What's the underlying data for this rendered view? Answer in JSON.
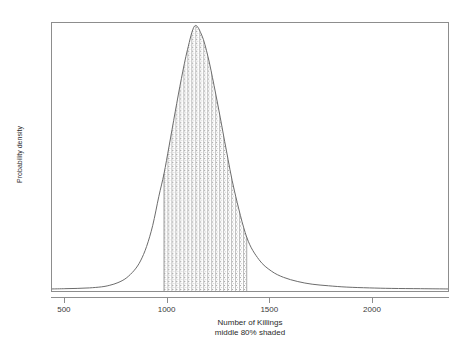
{
  "chart_data": {
    "type": "area",
    "title": "",
    "xlabel": "Number of Killings",
    "sublabel": "middle 80% shaded",
    "ylabel": "Probability density",
    "xlim": [
      437,
      2375
    ],
    "ylim": [
      0,
      1
    ],
    "grid": false,
    "legend": null,
    "xticks": [
      500,
      1000,
      1500,
      2000
    ],
    "xtick_labels": [
      "500",
      "1000",
      "1500",
      "2000"
    ],
    "yticks": [],
    "ytick_labels": [],
    "distribution": {
      "name": "right-skewed density of killings",
      "mode": 1135,
      "peak_density": 1.0,
      "shaded_interval": [
        985,
        1390
      ],
      "shaded_fraction": 0.8,
      "shading_style": "stipple-crosshatch"
    },
    "x": [
      437,
      500,
      560,
      620,
      680,
      720,
      760,
      800,
      840,
      870,
      900,
      930,
      960,
      985,
      1010,
      1040,
      1070,
      1100,
      1135,
      1170,
      1200,
      1230,
      1260,
      1290,
      1330,
      1390,
      1450,
      1510,
      1570,
      1640,
      1710,
      1790,
      1880,
      1990,
      2100,
      2240,
      2375
    ],
    "y": [
      0.004,
      0.005,
      0.006,
      0.008,
      0.012,
      0.018,
      0.028,
      0.045,
      0.075,
      0.11,
      0.165,
      0.245,
      0.355,
      0.44,
      0.545,
      0.675,
      0.8,
      0.91,
      1.0,
      0.965,
      0.885,
      0.775,
      0.655,
      0.53,
      0.375,
      0.2,
      0.115,
      0.072,
      0.048,
      0.032,
      0.022,
      0.016,
      0.011,
      0.008,
      0.006,
      0.005,
      0.004
    ],
    "colors": {
      "curve": "#6b6b6b",
      "frame": "#8d8d8d",
      "shading": "#9a9a9a",
      "background": "#ffffff",
      "text": "#2b2b2b"
    }
  }
}
